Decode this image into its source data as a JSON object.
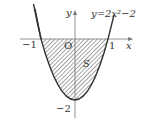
{
  "diagram": {
    "function_label": "y=2x²−2",
    "axis_x_label": "x",
    "axis_y_label": "y",
    "origin_label": "O",
    "tick_neg1": "−1",
    "tick_pos1": "1",
    "tick_neg2": "−2",
    "region_label": "S",
    "colors": {
      "curve": "#333333",
      "hatch": "#555555",
      "axis": "#777777"
    }
  }
}
